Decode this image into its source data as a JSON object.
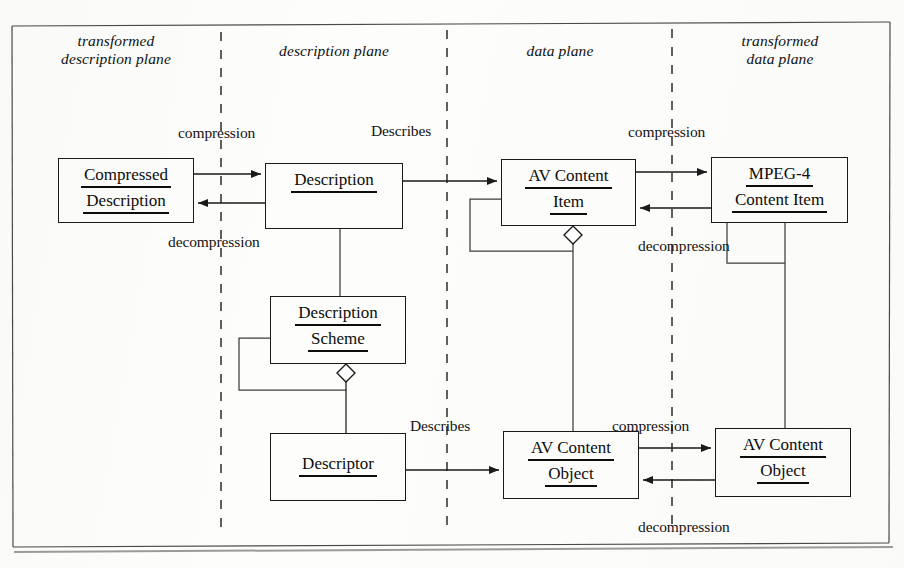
{
  "diagram": {
    "stroke_color": "#1a1a1a",
    "background_color": "#fdfdfb",
    "planes": [
      {
        "id": "transformed-description-plane",
        "label": "transformed\ndescription plane",
        "cx": 116,
        "cy": 52
      },
      {
        "id": "description-plane",
        "label": "description plane",
        "cx": 334,
        "cy": 52
      },
      {
        "id": "data-plane",
        "label": "data plane",
        "cx": 560,
        "cy": 52
      },
      {
        "id": "transformed-data-plane",
        "label": "transformed\ndata plane",
        "cx": 780,
        "cy": 52
      }
    ],
    "boxes": [
      {
        "id": "compressed-description",
        "lines": [
          "Compressed",
          "Description"
        ],
        "x": 58,
        "y": 158,
        "w": 136,
        "h": 65
      },
      {
        "id": "description",
        "lines": [
          "Description"
        ],
        "x": 265,
        "y": 163,
        "w": 138,
        "h": 66
      },
      {
        "id": "av-content-item",
        "lines": [
          "AV Content",
          "Item"
        ],
        "x": 501,
        "y": 159,
        "w": 135,
        "h": 67
      },
      {
        "id": "mpeg4-content-item",
        "lines": [
          "MPEG-4",
          "Content   Item"
        ],
        "x": 711,
        "y": 157,
        "w": 137,
        "h": 66
      },
      {
        "id": "description-scheme",
        "lines": [
          "Description",
          "Scheme"
        ],
        "x": 270,
        "y": 296,
        "w": 136,
        "h": 68
      },
      {
        "id": "descriptor",
        "lines": [
          "Descriptor"
        ],
        "x": 270,
        "y": 433,
        "w": 136,
        "h": 68
      },
      {
        "id": "av-content-object-left",
        "lines": [
          "AV Content",
          "Object"
        ],
        "x": 503,
        "y": 431,
        "w": 136,
        "h": 68
      },
      {
        "id": "av-content-object-right",
        "lines": [
          "AV Content",
          "Object"
        ],
        "x": 715,
        "y": 428,
        "w": 136,
        "h": 69
      }
    ],
    "edge_labels": [
      {
        "id": "compression-description",
        "text": "compression",
        "x": 178,
        "y": 124
      },
      {
        "id": "describes-item",
        "text": "Describes",
        "x": 371,
        "y": 122
      },
      {
        "id": "compression-item",
        "text": "compression",
        "x": 628,
        "y": 123
      },
      {
        "id": "decompression-description",
        "text": "decompression",
        "x": 168,
        "y": 233
      },
      {
        "id": "decompression-item",
        "text": "decompression",
        "x": 638,
        "y": 237
      },
      {
        "id": "describes-object",
        "text": "Describes",
        "x": 410,
        "y": 417
      },
      {
        "id": "compression-object",
        "text": "compression",
        "x": 612,
        "y": 417
      },
      {
        "id": "decompression-object",
        "text": "decompression",
        "x": 638,
        "y": 518
      }
    ],
    "dividers": [
      {
        "id": "divider-1",
        "x": 221
      },
      {
        "id": "divider-2",
        "x": 447
      },
      {
        "id": "divider-3",
        "x": 672
      }
    ],
    "relations": [
      {
        "id": "compressed-description-to-description",
        "kind": "arrow",
        "label": "compression"
      },
      {
        "id": "description-to-compressed-description",
        "kind": "arrow",
        "label": "decompression"
      },
      {
        "id": "description-to-av-content-item",
        "kind": "arrow",
        "label": "Describes"
      },
      {
        "id": "av-content-item-to-mpeg4",
        "kind": "arrow",
        "label": "compression"
      },
      {
        "id": "mpeg4-to-av-content-item",
        "kind": "arrow",
        "label": "decompression"
      },
      {
        "id": "description-to-description-scheme",
        "kind": "association",
        "label": ""
      },
      {
        "id": "description-scheme-aggregation-descriptor",
        "kind": "aggregation",
        "label": ""
      },
      {
        "id": "description-scheme-self-aggregation",
        "kind": "aggregation-self",
        "label": ""
      },
      {
        "id": "av-content-item-self-aggregation",
        "kind": "aggregation-self",
        "label": ""
      },
      {
        "id": "av-content-item-aggregation-object",
        "kind": "aggregation",
        "label": ""
      },
      {
        "id": "descriptor-to-av-content-object",
        "kind": "arrow",
        "label": "Describes"
      },
      {
        "id": "av-content-object-to-right",
        "kind": "arrow",
        "label": "compression"
      },
      {
        "id": "right-to-av-content-object",
        "kind": "arrow",
        "label": "decompression"
      },
      {
        "id": "mpeg4-aggregation-av-content-object-right",
        "kind": "aggregation",
        "label": ""
      }
    ]
  }
}
